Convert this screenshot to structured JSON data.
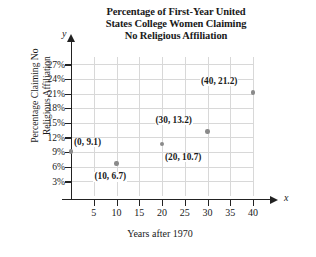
{
  "chart_data": {
    "type": "scatter",
    "title": "Percentage of First-Year United States College Women Claiming No Religious Affiliation",
    "title_lines": [
      "Percentage of First-Year United",
      "States College Women Claiming",
      "No Religious Affiliation"
    ],
    "xlabel": "Years after 1970",
    "ylabel": "Percentage Claiming No Religious Affiliation",
    "ylabel_lines": [
      "Percentage Claiming No",
      "Religious Affiliation"
    ],
    "x_axis_letter": "y",
    "y_axis_letter": "x",
    "axis_letters": {
      "vertical": "y",
      "horizontal": "x"
    },
    "xlim": [
      0,
      40
    ],
    "ylim": [
      0,
      28.5
    ],
    "xticks": [
      5,
      10,
      15,
      20,
      25,
      30,
      35,
      40
    ],
    "xtick_labels": [
      "5",
      "10",
      "15",
      "20",
      "25",
      "30",
      "35",
      "40"
    ],
    "yticks": [
      3,
      6,
      9,
      12,
      15,
      18,
      21,
      24,
      27
    ],
    "ytick_labels": [
      "3%",
      "6%",
      "9%",
      "12%",
      "15%",
      "18%",
      "21%",
      "24%",
      "27%"
    ],
    "grid": true,
    "grid_color": "#d8d8d8",
    "legend": null,
    "marker_color": "#8a8a8a",
    "x": [
      0,
      10,
      20,
      30,
      40
    ],
    "y": [
      9.1,
      6.7,
      10.7,
      13.2,
      21.2
    ],
    "points": [
      {
        "x": 0,
        "y": 9.1,
        "label": "(0, 9.1)",
        "label_pos": "above-right"
      },
      {
        "x": 10,
        "y": 6.7,
        "label": "(10, 6.7)",
        "label_pos": "below"
      },
      {
        "x": 20,
        "y": 10.7,
        "label": "(20, 10.7)",
        "label_pos": "below-right"
      },
      {
        "x": 30,
        "y": 13.2,
        "label": "(30, 13.2)",
        "label_pos": "above-left"
      },
      {
        "x": 40,
        "y": 21.2,
        "label": "(40, 21.2)",
        "label_pos": "above-left"
      }
    ]
  }
}
